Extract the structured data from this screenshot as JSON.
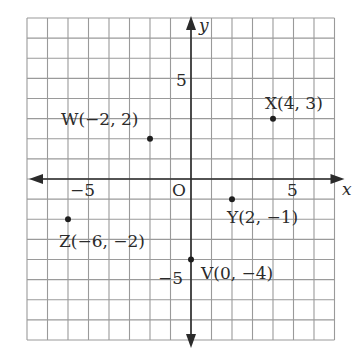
{
  "diagram": {
    "type": "coordinate-plane",
    "grid": {
      "x_min": -8,
      "x_max": 7,
      "y_min": -8,
      "y_max": 8,
      "origin_px": [
        191,
        179
      ],
      "unit_px_x": 20.5,
      "unit_px_y": 20.125,
      "line_color": "#9a9a9a",
      "axis_color": "#2b2b2b"
    },
    "axes": {
      "x_label": "x",
      "y_label": "y",
      "origin_label": "O",
      "ticks": [
        {
          "axis": "x",
          "value": -5,
          "text": "−5"
        },
        {
          "axis": "x",
          "value": 5,
          "text": "5"
        },
        {
          "axis": "y",
          "value": 5,
          "text": "5"
        },
        {
          "axis": "y",
          "value": -5,
          "text": "−5"
        }
      ]
    },
    "points": [
      {
        "name": "W",
        "x": -2,
        "y": 2,
        "label": "W(−2, 2)"
      },
      {
        "name": "X",
        "x": 4,
        "y": 3,
        "label": "X(4, 3)"
      },
      {
        "name": "Y",
        "x": 2,
        "y": -1,
        "label": "Y(2, −1)"
      },
      {
        "name": "Z",
        "x": -6,
        "y": -2,
        "label": "Z(−6, −2)"
      },
      {
        "name": "V",
        "x": 0,
        "y": -4,
        "label": "V(0, −4)"
      }
    ]
  }
}
